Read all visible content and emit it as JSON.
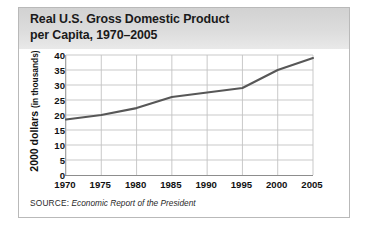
{
  "figure": {
    "title": "Real U.S. Gross Domestic Product\nper Capita, 1970–2005",
    "source_label": "SOURCE:",
    "source_title": "Economic Report of the President",
    "y_axis_label_main": "2000 dollars",
    "y_axis_label_sub": "(in thousands)"
  },
  "chart_data": {
    "type": "line",
    "title": "Real U.S. Gross Domestic Product per Capita, 1970–2005",
    "xlabel": "",
    "ylabel": "2000 dollars (in thousands)",
    "categories": [
      "1970",
      "1975",
      "1980",
      "1985",
      "1990",
      "1995",
      "2000",
      "2005"
    ],
    "x": [
      1970,
      1975,
      1980,
      1985,
      1990,
      1995,
      2000,
      2005
    ],
    "values": [
      18.5,
      20.0,
      22.3,
      26.0,
      27.5,
      29.0,
      35.0,
      39.0
    ],
    "series": [
      {
        "name": "Real GDP per capita",
        "values": [
          18.5,
          20.0,
          22.3,
          26.0,
          27.5,
          29.0,
          35.0,
          39.0
        ]
      }
    ],
    "xlim": [
      1970,
      2005
    ],
    "ylim": [
      0,
      40
    ],
    "yticks": [
      0,
      5,
      10,
      15,
      20,
      25,
      30,
      35,
      40
    ],
    "xticks": [
      1970,
      1975,
      1980,
      1985,
      1990,
      1995,
      2000,
      2005
    ],
    "grid": true,
    "legend": false,
    "line_color": "#575757",
    "grid_color": "#c3c3c3",
    "axis_color": "#8d8d8d"
  }
}
